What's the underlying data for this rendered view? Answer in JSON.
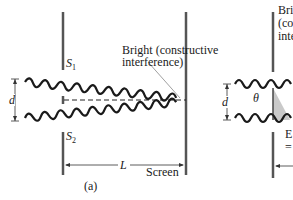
{
  "figure_a": {
    "label": "(a)",
    "source_top": "S",
    "source_top_sub": "1",
    "source_bottom": "S",
    "source_bottom_sub": "2",
    "separation": "d",
    "distance": "L",
    "screen_label": "Screen",
    "bright_label_line1": "Bright (constructive",
    "bright_label_line2": "interference)"
  },
  "figure_b": {
    "separation": "d",
    "angle": "θ",
    "bright_label_line1": "Bri",
    "bright_label_line2": "(co",
    "bright_label_line3": "inte",
    "bottom_label_line1": "E",
    "bottom_label_line2": "="
  },
  "colors": {
    "wall": "#555555",
    "wave": "#1a1a1a",
    "wedge": "#bbbbbb"
  }
}
